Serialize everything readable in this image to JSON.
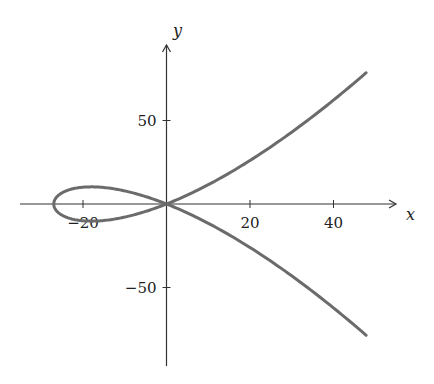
{
  "chart_data": {
    "type": "line",
    "title": "",
    "xlabel": "x",
    "ylabel": "y",
    "xlim": [
      -35,
      55
    ],
    "ylim": [
      -98,
      97
    ],
    "x_ticks": [
      -20,
      20,
      40
    ],
    "x_tick_labels": [
      "−20",
      "20",
      "40"
    ],
    "y_ticks": [
      50,
      -50
    ],
    "y_tick_labels": [
      "50",
      "−50"
    ],
    "grid": false,
    "legend": null,
    "series": [
      {
        "name": "curve",
        "color": "#6b6b6b",
        "parametric": {
          "x": "t^2 - 27",
          "y": "0.19*t*(t^2 - 27)",
          "t_range": [
            -8.65,
            8.65
          ]
        },
        "points": [
          {
            "x": 47.8,
            "y": -79
          },
          {
            "x": 22,
            "y": -32.6
          },
          {
            "x": 0,
            "y": 0
          },
          {
            "x": -18,
            "y": 10.3
          },
          {
            "x": -27,
            "y": 0
          },
          {
            "x": -18,
            "y": -10.3
          },
          {
            "x": 0,
            "y": 0
          },
          {
            "x": 22,
            "y": 32.6
          },
          {
            "x": 47.8,
            "y": 79
          }
        ]
      }
    ]
  },
  "pixel_map": {
    "origin_x": 166.5,
    "origin_y": 204,
    "px_per_x": 4.175,
    "px_per_y": 1.67,
    "x_axis_start": 20,
    "x_axis_end": 396,
    "y_axis_top": 45,
    "y_axis_bottom": 366
  }
}
